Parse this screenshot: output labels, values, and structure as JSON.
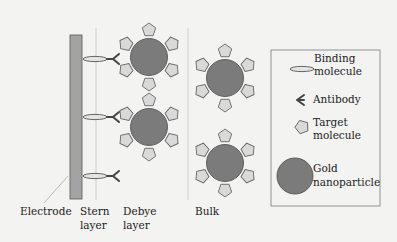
{
  "regions": {
    "electrode": "Electrode",
    "stern": [
      "Stern",
      "layer"
    ],
    "debye": [
      "Debye",
      "layer"
    ],
    "bulk": "Bulk"
  },
  "legend": {
    "items": [
      {
        "icon": "binding-molecule-icon",
        "lines": [
          "Binding",
          "molecule"
        ]
      },
      {
        "icon": "antibody-icon",
        "lines": [
          "Antibody"
        ]
      },
      {
        "icon": "target-molecule-icon",
        "lines": [
          "Target",
          "molecule"
        ]
      },
      {
        "icon": "gold-nanoparticle-icon",
        "lines": [
          "Gold",
          "nanoparticle"
        ]
      }
    ]
  },
  "colors": {
    "background": "#f3f3f2",
    "electrode": "#a3a3a3",
    "nanoparticle": "#7b7b7b",
    "pentagon": "#d9d9d9",
    "outline": "#555555",
    "layer_line": "#c4c4c4"
  }
}
